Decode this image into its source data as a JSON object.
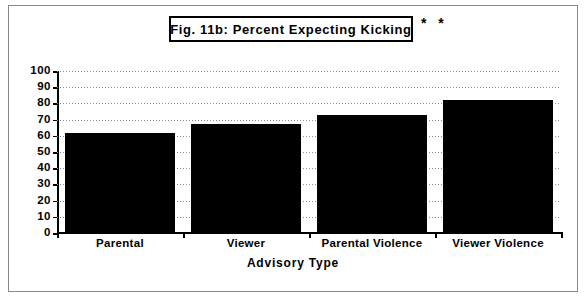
{
  "figure": {
    "title": "Fig. 11b:  Percent Expecting Kicking",
    "significance_marks": "* *"
  },
  "chart_data": {
    "type": "bar",
    "title": "Fig. 11b:  Percent Expecting Kicking",
    "categories": [
      "Parental",
      "Viewer",
      "Parental Violence",
      "Viewer Violence"
    ],
    "values": [
      62,
      67,
      73,
      82
    ],
    "xlabel": "Advisory  Type",
    "ylabel": "",
    "ylim": [
      0,
      100
    ],
    "ytick_labels": [
      "100",
      "90",
      "80",
      "70",
      "60",
      "50",
      "40",
      "30",
      "20",
      "10",
      "0"
    ],
    "ytick_values": [
      100,
      90,
      80,
      70,
      60,
      50,
      40,
      30,
      20,
      10,
      0
    ],
    "grid": true,
    "legend": "none",
    "bar_color": "#000000",
    "annotation": "* *"
  }
}
